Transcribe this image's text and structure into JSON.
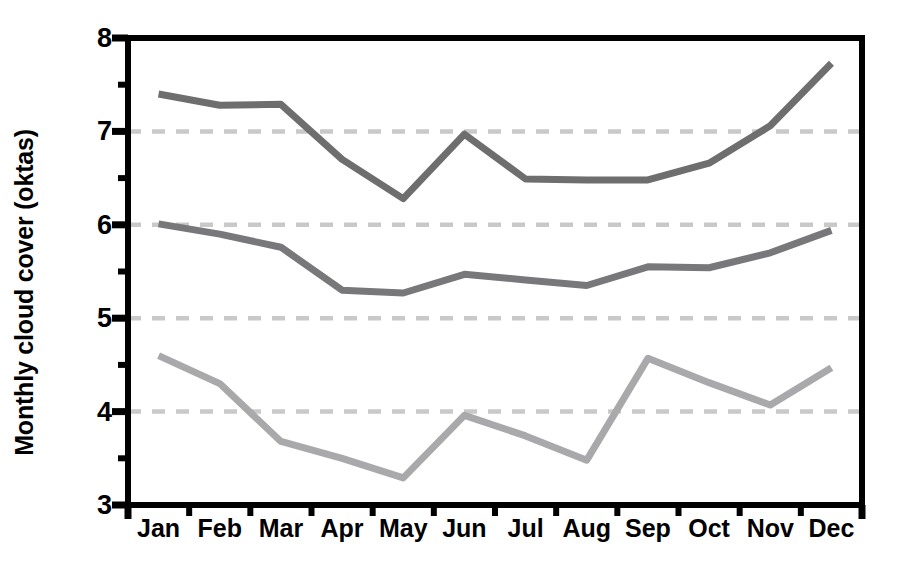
{
  "chart_data": {
    "type": "line",
    "title": "",
    "xlabel": "",
    "ylabel": "Monthly cloud cover (oktas)",
    "categories": [
      "Jan",
      "Feb",
      "Mar",
      "Apr",
      "May",
      "Jun",
      "Jul",
      "Aug",
      "Sep",
      "Oct",
      "Nov",
      "Dec"
    ],
    "ylim": [
      3,
      8
    ],
    "yticks": [
      3,
      4,
      5,
      6,
      7,
      8
    ],
    "ytick_labels": [
      "3",
      "4",
      "5",
      "6",
      "7",
      "8"
    ],
    "minor_yticks": [
      3.5,
      4.5,
      5.5,
      6.5,
      7.5
    ],
    "gridlines": [
      4,
      5,
      6,
      7
    ],
    "grid": "horizontal-dashed",
    "legend": "none",
    "series": [
      {
        "name": "upper",
        "color": "#6e6e6e",
        "values": [
          7.4,
          7.28,
          7.29,
          6.7,
          6.28,
          6.97,
          6.49,
          6.48,
          6.48,
          6.66,
          7.06,
          7.73
        ]
      },
      {
        "name": "middle",
        "color": "#78787a",
        "values": [
          6.01,
          5.9,
          5.76,
          5.3,
          5.27,
          5.47,
          5.41,
          5.35,
          5.55,
          5.54,
          5.7,
          5.94
        ]
      },
      {
        "name": "lower",
        "color": "#a9a9ab",
        "values": [
          4.6,
          4.3,
          3.68,
          3.5,
          3.29,
          3.96,
          3.74,
          3.48,
          4.57,
          4.31,
          4.07,
          4.47
        ]
      }
    ]
  },
  "axes": {
    "frame_color": "#000000",
    "grid_color": "#c9c9c9",
    "background": "#ffffff"
  }
}
